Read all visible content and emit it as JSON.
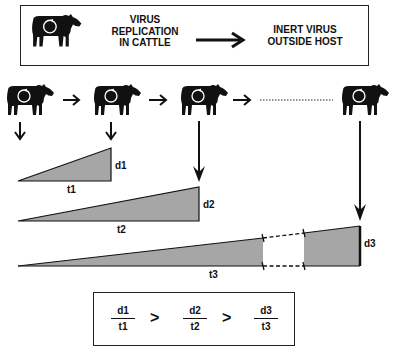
{
  "header_box": {
    "left_label_lines": [
      "VIRUS",
      "REPLICATION",
      "IN CATTLE"
    ],
    "right_label_lines": [
      "INERT VIRUS",
      "OUTSIDE HOST"
    ],
    "arrow": "right-arrow"
  },
  "cattle_sequence": {
    "icons": [
      "cow-icon",
      "cow-icon",
      "cow-icon",
      "cow-icon"
    ],
    "connector_types": [
      "arrow",
      "arrow",
      "arrow",
      "dotted-line"
    ]
  },
  "triangles": [
    {
      "height_label": "d1",
      "base_label": "t1"
    },
    {
      "height_label": "d2",
      "base_label": "t2"
    },
    {
      "height_label": "d3",
      "base_label": "t3",
      "has_gap": true
    }
  ],
  "inequality_box": {
    "fractions": [
      {
        "num": "d1",
        "den": "t1"
      },
      {
        "num": "d2",
        "den": "t2"
      },
      {
        "num": "d3",
        "den": "t3"
      }
    ],
    "operator": ">"
  },
  "colors": {
    "fill": "#a6a6a6",
    "stroke": "#111111",
    "background": "#ffffff"
  }
}
